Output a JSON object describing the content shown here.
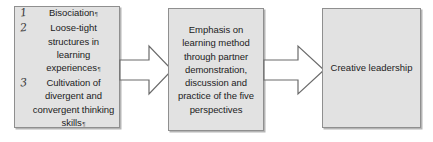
{
  "diagram": {
    "type": "process-flow",
    "orientation": "left-to-right",
    "background_color": "#ffffff",
    "box_fill_color": "#e2e2e2",
    "box_border_color": "#8f8f8f",
    "arrow_fill_color": "#ffffff",
    "arrow_border_color": "#6b6b6b",
    "text_color": "#1c1c1c",
    "stages": [
      {
        "id": "inputs",
        "kind": "numbered-list",
        "items": [
          {
            "number": "1",
            "text": "Bisociation",
            "trailing_mark": "¶"
          },
          {
            "number": "2",
            "text": "Loose-tight structures in learning experiences",
            "trailing_mark": "¶"
          },
          {
            "number": "3",
            "text": "Cultivation of divergent and convergent thinking skills",
            "trailing_mark": "¶"
          }
        ]
      },
      {
        "id": "process",
        "kind": "paragraph",
        "text": "Emphasis on learning method through partner demonstration, discussion and practice of the five perspectives"
      },
      {
        "id": "outcome",
        "kind": "paragraph",
        "text": "Creative leadership"
      }
    ],
    "connectors": [
      {
        "id": "connector-1",
        "shape": "block-arrow",
        "direction": "right"
      },
      {
        "id": "connector-2",
        "shape": "block-arrow",
        "direction": "right"
      }
    ]
  }
}
